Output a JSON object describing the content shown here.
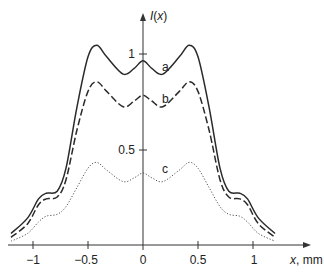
{
  "chart_data": {
    "type": "line",
    "title": "",
    "xlabel": "x, mm",
    "ylabel": "I(x)",
    "xlim": [
      -1.2,
      1.5
    ],
    "ylim": [
      0,
      1.2
    ],
    "grid": false,
    "legend": "inline labels a, b, c",
    "x_ticks": [
      -1,
      -0.5,
      0,
      0.5,
      1
    ],
    "x_tick_labels": [
      "−1",
      "−0.5",
      "0",
      "0.5",
      "1"
    ],
    "y_ticks": [
      0.5,
      1
    ],
    "y_tick_labels": [
      "0.5",
      "1"
    ],
    "x": [
      -1.2,
      -1.05,
      -0.95,
      -0.88,
      -0.78,
      -0.7,
      -0.6,
      -0.5,
      -0.42,
      -0.33,
      -0.18,
      -0.08,
      0,
      0.08,
      0.18,
      0.33,
      0.42,
      0.5,
      0.6,
      0.7,
      0.78,
      0.88,
      0.95,
      1.05,
      1.2
    ],
    "series": [
      {
        "name": "a",
        "style": "solid",
        "values": [
          0.06,
          0.14,
          0.24,
          0.27,
          0.28,
          0.4,
          0.72,
          0.98,
          1.04,
          0.98,
          0.89,
          0.92,
          0.96,
          0.92,
          0.89,
          0.98,
          1.04,
          0.98,
          0.72,
          0.4,
          0.28,
          0.27,
          0.24,
          0.14,
          0.06
        ]
      },
      {
        "name": "b",
        "style": "dashed",
        "values": [
          0.04,
          0.11,
          0.21,
          0.24,
          0.25,
          0.34,
          0.6,
          0.8,
          0.85,
          0.8,
          0.72,
          0.75,
          0.78,
          0.75,
          0.72,
          0.8,
          0.85,
          0.8,
          0.6,
          0.34,
          0.25,
          0.24,
          0.21,
          0.11,
          0.04
        ]
      },
      {
        "name": "c",
        "style": "dotted",
        "values": [
          0.02,
          0.06,
          0.12,
          0.15,
          0.16,
          0.2,
          0.3,
          0.4,
          0.43,
          0.39,
          0.33,
          0.35,
          0.375,
          0.35,
          0.33,
          0.39,
          0.43,
          0.4,
          0.3,
          0.2,
          0.16,
          0.15,
          0.12,
          0.06,
          0.02
        ]
      }
    ]
  },
  "labels": {
    "y_axis": "I(x)",
    "x_axis": "x, mm",
    "curve_a": "a",
    "curve_b": "b",
    "curve_c": "c",
    "tick_x_m1": "−1",
    "tick_x_m05": "−0.5",
    "tick_x_0": "0",
    "tick_x_05": "0.5",
    "tick_x_1": "1",
    "tick_y_05": "0.5",
    "tick_y_1": "1"
  },
  "colors": {
    "line": "#2a2a2a",
    "axis": "#333333"
  }
}
